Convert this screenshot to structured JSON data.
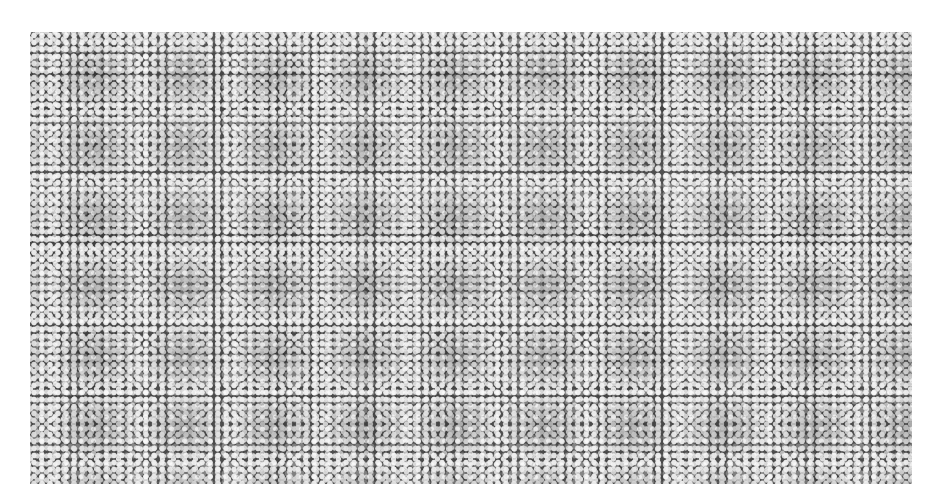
{
  "image": {
    "description": "Grayscale image of densely packed small bright spheres on a dark background",
    "colors": {
      "background": "#ffffff",
      "field": "#4e4e4e",
      "dots": "#f0f0f0"
    }
  }
}
